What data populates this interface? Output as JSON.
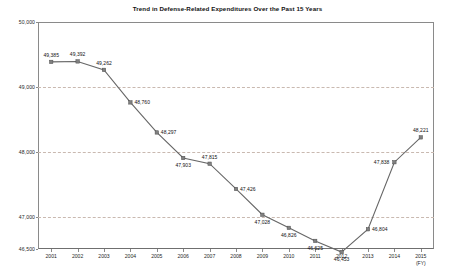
{
  "chart_data": {
    "type": "line",
    "title": "Trend in Defense-Related Expenditures Over the Past 15 Years",
    "xlabel": "(FY)",
    "ylabel": "",
    "categories": [
      "2001",
      "2002",
      "2003",
      "2004",
      "2005",
      "2006",
      "2007",
      "2008",
      "2009",
      "2010",
      "2011",
      "2012",
      "2013",
      "2014",
      "2015"
    ],
    "values": [
      49385,
      49392,
      49262,
      48760,
      48297,
      47903,
      47815,
      47426,
      47028,
      46826,
      46625,
      46453,
      46804,
      47838,
      48221
    ],
    "value_labels": [
      "49,385",
      "49,392",
      "49,262",
      "48,760",
      "48,297",
      "47,903",
      "47,815",
      "47,426",
      "47,028",
      "46,826",
      "46,625",
      "46,453",
      "46,804",
      "47,838",
      "48,221"
    ],
    "ylim": [
      46500,
      50000
    ],
    "yticks": [
      50000,
      49000,
      48000,
      47000,
      46500
    ],
    "ytick_labels": [
      "50,000",
      "49,000",
      "48,000",
      "47,000",
      "46,500"
    ],
    "gridlines": [
      49000,
      48000,
      47000
    ],
    "grid": true,
    "legend": "none",
    "series_color": "#666666",
    "marker_color": "#808080",
    "grid_color": "#c9b9b0",
    "axis_color": "#8a8a8a"
  }
}
